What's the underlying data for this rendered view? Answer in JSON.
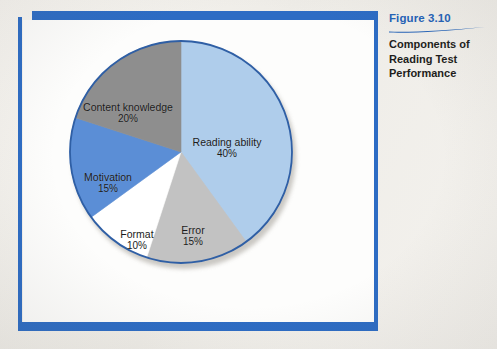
{
  "figure": {
    "number_label": "Figure 3.10",
    "title_line_1": "Components of",
    "title_line_2": "Reading Test",
    "title_line_3": "Performance",
    "number_color": "#2362b8",
    "title_color": "#1d1d1b",
    "frame_color": "#2d6cc4"
  },
  "chart_data": {
    "type": "pie",
    "title": "Components of Reading Test Performance",
    "start_angle_deg": 0,
    "direction": "clockwise",
    "total": 100,
    "unit": "%",
    "legend": "none (labels drawn inside slices)",
    "grid": false,
    "categories": [
      "Reading ability",
      "Error",
      "Format",
      "Motivation",
      "Content knowledge"
    ],
    "values": [
      40,
      15,
      10,
      15,
      20
    ],
    "colors": [
      "#afcdeb",
      "#c2c2c2",
      "#ffffff",
      "#5b8ed6",
      "#8e8e8e"
    ],
    "slices": [
      {
        "label": "Reading ability",
        "value": 40,
        "value_text": "40%",
        "color": "#afcdeb",
        "start_deg": 0,
        "end_deg": 144
      },
      {
        "label": "Error",
        "value": 15,
        "value_text": "15%",
        "color": "#c2c2c2",
        "start_deg": 144,
        "end_deg": 198
      },
      {
        "label": "Format",
        "value": 10,
        "value_text": "10%",
        "color": "#ffffff",
        "start_deg": 198,
        "end_deg": 234
      },
      {
        "label": "Motivation",
        "value": 15,
        "value_text": "15%",
        "color": "#5b8ed6",
        "start_deg": 234,
        "end_deg": 288
      },
      {
        "label": "Content knowledge",
        "value": 20,
        "value_text": "20%",
        "color": "#8e8e8e",
        "start_deg": 288,
        "end_deg": 360
      }
    ],
    "outline_color": "#2f5fa5"
  }
}
